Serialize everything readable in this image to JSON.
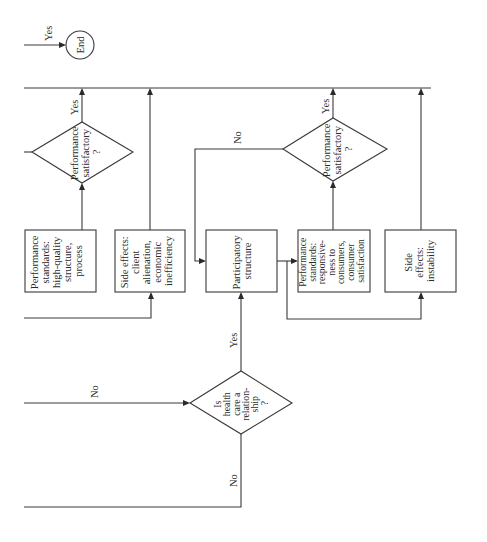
{
  "diagram": {
    "orientation": "rotated 90 degrees counter-clockwise",
    "terminal": {
      "end_label": "End"
    },
    "decisions": {
      "relationship": {
        "lines": [
          "Is",
          "health",
          "care a",
          "relation-",
          "ship",
          "?"
        ]
      },
      "performance_1": {
        "lines": [
          "Performance",
          "satisfactory",
          "?"
        ]
      },
      "performance_2": {
        "lines": [
          "Performance",
          "satisfactory",
          "?"
        ]
      }
    },
    "boxes": {
      "standards_1": {
        "lines": [
          "Performance",
          "standards:",
          "high-quality",
          "structure,",
          "process"
        ]
      },
      "side_effects_1": {
        "lines": [
          "Side effects:",
          "client",
          "alienation,",
          "economic",
          "inefficiency"
        ]
      },
      "participatory": {
        "lines": [
          "Participatory",
          "structure"
        ]
      },
      "standards_2": {
        "lines": [
          "Performance",
          "standards:",
          "responsive-",
          "ness to",
          "consumers,",
          "consumer",
          "satisfaction"
        ]
      },
      "side_effects_2": {
        "lines": [
          "Side",
          "effects:",
          "instability"
        ]
      }
    },
    "edge_labels": {
      "yes_end": "Yes",
      "yes_perf1": "Yes",
      "yes_perf2": "Yes",
      "no_perf2": "No",
      "no_into_relationship": "No",
      "yes_relationship": "Yes",
      "no_relationship": "No"
    }
  }
}
